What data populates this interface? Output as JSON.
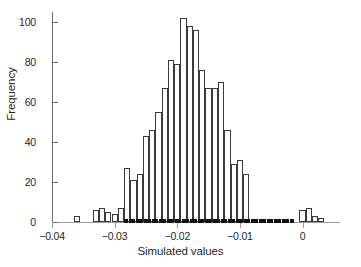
{
  "chart_data": {
    "type": "bar",
    "title": "",
    "subtitle": "",
    "xlabel": "Simulated values",
    "ylabel": "Frequency",
    "xlim": [
      -0.04,
      0.0055
    ],
    "ylim": [
      0,
      105
    ],
    "grid": false,
    "legend": null,
    "bin_width": 0.001,
    "xticks": [
      -0.04,
      -0.03,
      -0.02,
      -0.01,
      0
    ],
    "xticklabels": [
      "−0.04",
      "−0.03",
      "−0.02",
      "−0.01",
      "0"
    ],
    "yticks": [
      0,
      20,
      40,
      60,
      80,
      100
    ],
    "yticklabels": [
      "0",
      "20",
      "40",
      "60",
      "80",
      "100"
    ],
    "bin_left_edges": [
      -0.0365,
      -0.0355,
      -0.0345,
      -0.0335,
      -0.0325,
      -0.0315,
      -0.0305,
      -0.0295,
      -0.0285,
      -0.0275,
      -0.0265,
      -0.0255,
      -0.0245,
      -0.0235,
      -0.0225,
      -0.0215,
      -0.0205,
      -0.0195,
      -0.0185,
      -0.0175,
      -0.0165,
      -0.0155,
      -0.0145,
      -0.0135,
      -0.0125,
      -0.0115,
      -0.0105,
      -0.0095,
      -0.0085,
      -0.0075,
      -0.0065,
      -0.0055,
      -0.0045,
      -0.0035,
      -0.0025,
      -0.0015,
      -0.0005,
      0.0005,
      0.0015,
      0.0025,
      0.0035,
      0.0045
    ],
    "categories": [
      "-0.0365",
      "-0.0355",
      "-0.0345",
      "-0.0335",
      "-0.0325",
      "-0.0315",
      "-0.0305",
      "-0.0295",
      "-0.0285",
      "-0.0275",
      "-0.0265",
      "-0.0255",
      "-0.0245",
      "-0.0235",
      "-0.0225",
      "-0.0215",
      "-0.0205",
      "-0.0195",
      "-0.0185",
      "-0.0175",
      "-0.0165",
      "-0.0155",
      "-0.0145",
      "-0.0135",
      "-0.0125",
      "-0.0115",
      "-0.0105",
      "-0.0095",
      "-0.0085",
      "-0.0075",
      "-0.0065",
      "-0.0055",
      "-0.0045",
      "-0.0035",
      "-0.0025",
      "-0.0015",
      "-0.0005",
      "0.0005",
      "0.0015",
      "0.0025",
      "0.0035",
      "0.0045"
    ],
    "values": [
      3,
      0,
      0,
      6,
      7,
      5,
      4,
      7,
      27,
      21,
      24,
      43,
      46,
      55,
      67,
      81,
      79,
      102,
      98,
      96,
      76,
      67,
      67,
      70,
      46,
      29,
      31,
      24,
      0,
      0,
      0,
      0,
      0,
      0,
      0,
      0,
      6,
      7,
      3,
      2,
      0,
      0
    ],
    "series": [
      {
        "name": "Frequency",
        "values": [
          3,
          0,
          0,
          6,
          7,
          5,
          4,
          7,
          27,
          21,
          24,
          43,
          46,
          55,
          67,
          81,
          79,
          102,
          98,
          96,
          76,
          67,
          67,
          70,
          46,
          29,
          31,
          24,
          0,
          0,
          0,
          0,
          0,
          0,
          0,
          0,
          6,
          7,
          3,
          2,
          0,
          0
        ]
      }
    ],
    "rug": {
      "present": true,
      "range": [
        -0.0285,
        -0.0015
      ],
      "description": "dense black rug ticks along baseline"
    },
    "style": {
      "bar_fill": "#ffffff",
      "bar_edge": "#3a3a3a",
      "axis_color": "#6e6e6e",
      "text_color": "#1f1f1f"
    }
  }
}
